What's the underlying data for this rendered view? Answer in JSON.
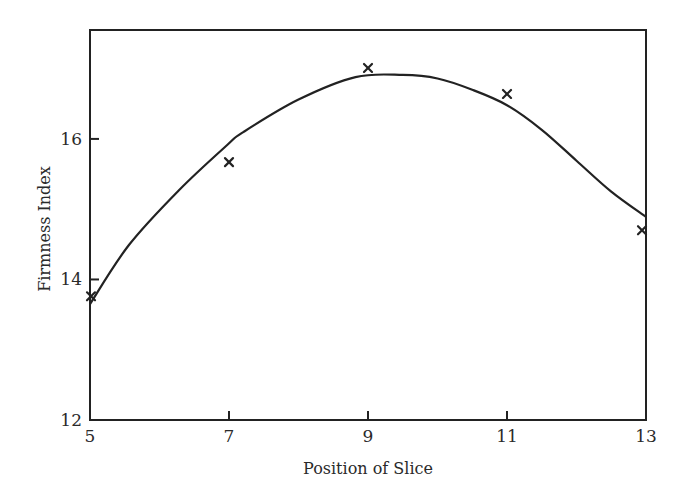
{
  "chart_data": {
    "type": "scatter",
    "title": "",
    "xlabel": "Position of Slice",
    "ylabel": "Firmness Index",
    "xlim": [
      5,
      13
    ],
    "ylim": [
      12,
      17.55
    ],
    "x_ticks": [
      5,
      7,
      9,
      11,
      13
    ],
    "y_ticks": [
      12,
      14,
      16
    ],
    "grid": false,
    "legend": null,
    "series": [
      {
        "name": "Observed",
        "kind": "scatter",
        "marker": "x",
        "x": [
          5,
          7,
          9,
          11,
          13
        ],
        "y": [
          13.76,
          15.67,
          17.01,
          16.64,
          14.7
        ]
      },
      {
        "name": "Fitted curve",
        "kind": "line",
        "x": [
          5,
          5.56,
          6.28,
          6.97,
          7.21,
          8.0,
          8.82,
          9.5,
          10.0,
          10.5,
          11.0,
          11.5,
          12.0,
          12.5,
          13.0
        ],
        "y": [
          13.65,
          14.49,
          15.27,
          15.91,
          16.1,
          16.56,
          16.88,
          16.91,
          16.86,
          16.7,
          16.48,
          16.13,
          15.69,
          15.25,
          14.89
        ]
      }
    ]
  },
  "axes": {
    "x_tick_labels": [
      "5",
      "7",
      "9",
      "11",
      "13"
    ],
    "y_tick_labels": [
      "12",
      "14",
      "16"
    ],
    "xlabel": "Position of Slice",
    "ylabel": "Firmness Index"
  }
}
